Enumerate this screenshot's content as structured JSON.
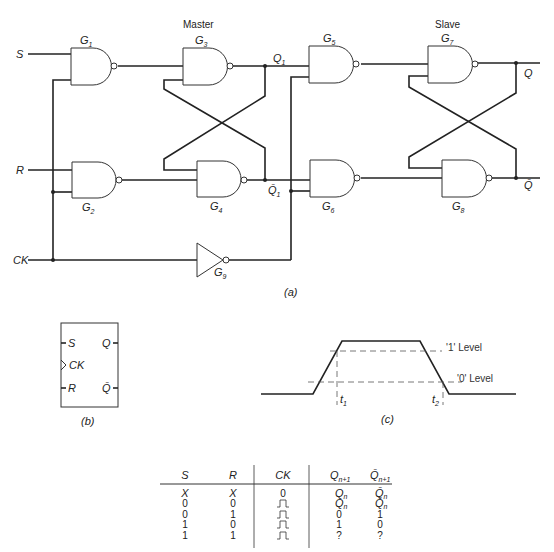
{
  "figure_a": {
    "caption": "(a)",
    "master_label": "Master",
    "slave_label": "Slave",
    "inputs": {
      "s": "S",
      "r": "R",
      "ck": "CK"
    },
    "gates": [
      {
        "id": "G1",
        "letter": "G",
        "sub": "1",
        "type": "NAND"
      },
      {
        "id": "G2",
        "letter": "G",
        "sub": "2",
        "type": "NAND"
      },
      {
        "id": "G3",
        "letter": "G",
        "sub": "3",
        "type": "NAND"
      },
      {
        "id": "G4",
        "letter": "G",
        "sub": "4",
        "type": "NAND"
      },
      {
        "id": "G5",
        "letter": "G",
        "sub": "5",
        "type": "NAND"
      },
      {
        "id": "G6",
        "letter": "G",
        "sub": "6",
        "type": "NAND"
      },
      {
        "id": "G7",
        "letter": "G",
        "sub": "7",
        "type": "NAND"
      },
      {
        "id": "G8",
        "letter": "G",
        "sub": "8",
        "type": "NAND"
      },
      {
        "id": "G9",
        "letter": "G",
        "sub": "9",
        "type": "NOT"
      }
    ],
    "nodes": {
      "q1": {
        "letter": "Q",
        "sub": "1"
      },
      "q1_bar": {
        "letter": "Q̄",
        "sub": "1"
      },
      "q": "Q",
      "q_bar": "Q̄"
    }
  },
  "figure_b": {
    "caption": "(b)",
    "pins_left": [
      "S",
      "CK",
      "R"
    ],
    "pins_right": [
      "Q",
      "Q̄"
    ]
  },
  "figure_c": {
    "caption": "(c)",
    "level_1": "'1' Level",
    "level_0": "'0' Level",
    "t1": {
      "letter": "t",
      "sub": "1"
    },
    "t2": {
      "letter": "t",
      "sub": "2"
    }
  },
  "truth_table": {
    "headers": [
      {
        "main": "S",
        "sub": ""
      },
      {
        "main": "R",
        "sub": ""
      },
      {
        "main": "CK",
        "sub": ""
      },
      {
        "main": "Q",
        "sub": "n+1"
      },
      {
        "main": "Q̄",
        "sub": "n+1"
      }
    ],
    "rows": [
      [
        "X",
        "X",
        "0",
        "Qn",
        "Q̄n"
      ],
      [
        "0",
        "0",
        "pulse",
        "Qn",
        "Q̄n"
      ],
      [
        "0",
        "1",
        "pulse",
        "0",
        "1"
      ],
      [
        "1",
        "0",
        "pulse",
        "1",
        "0"
      ],
      [
        "1",
        "1",
        "pulse",
        "?",
        "?"
      ]
    ]
  }
}
